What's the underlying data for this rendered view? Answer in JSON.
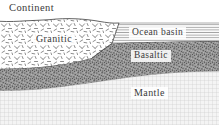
{
  "figure": {
    "type": "geological-cross-section"
  },
  "labels": {
    "continent": "Continent",
    "granitic": "Granitic",
    "ocean_basin": "Ocean basin",
    "basaltic": "Basaltic",
    "mantle": "Mantle"
  },
  "layers": [
    {
      "name": "continent",
      "label": "Continent",
      "pattern": "short-dash-hatch",
      "fill": "#ffffff",
      "stroke": "#555555",
      "position": "upper-left block above sea level"
    },
    {
      "name": "granitic-crust",
      "label": "Granitic",
      "pattern": "random-dash-and-v-marks",
      "fill": "#ffffff",
      "stroke": "#4a4a4a",
      "position": "thick left wedge tapering to a point toward the right"
    },
    {
      "name": "ocean-basin",
      "label": "Ocean basin",
      "pattern": "horizontal-lines",
      "fill": "#f2f2f2",
      "stroke": "#9a9a9a",
      "position": "upper-right water layer"
    },
    {
      "name": "basaltic-crust",
      "label": "Basaltic",
      "pattern": "dense-stipple",
      "fill": "#8d8d8d",
      "stroke": "#4a4a4a",
      "position": "dark band beneath granite, thinning to the right"
    },
    {
      "name": "mantle",
      "label": "Mantle",
      "pattern": "fine-cross-hatch-grid",
      "fill": "#f0f0f0",
      "stroke": "#c2c2c2",
      "position": "bottom layer spanning full width"
    }
  ],
  "colors": {
    "ink": "#3a3a3a",
    "basalt": "#8d8d8d",
    "mantle": "#efefef",
    "ocean_line": "#9a9a9a",
    "page": "#ffffff"
  }
}
